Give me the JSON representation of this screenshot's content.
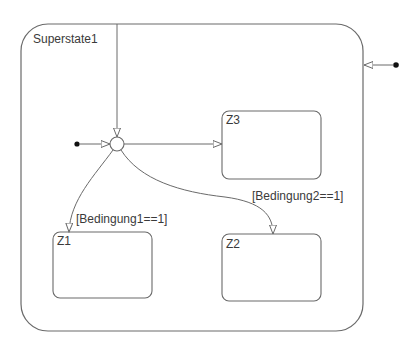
{
  "diagram": {
    "type": "statechart",
    "colors": {
      "line": "#6a6a6a",
      "text": "#3a3a3a",
      "background": "#ffffff",
      "dot": "#111111"
    },
    "superstate": {
      "name": "Superstate1"
    },
    "states": [
      {
        "id": "z3",
        "name": "Z3"
      },
      {
        "id": "z1",
        "name": "Z1"
      },
      {
        "id": "z2",
        "name": "Z2"
      }
    ],
    "junction": {
      "type": "connective-junction"
    },
    "transitions": [
      {
        "from": "external-top",
        "to": "junction",
        "label": ""
      },
      {
        "from": "default-inner",
        "to": "junction",
        "label": ""
      },
      {
        "from": "junction",
        "to": "Z3",
        "label": ""
      },
      {
        "from": "junction",
        "to": "Z1",
        "label": "[Bedingung1==1]"
      },
      {
        "from": "junction",
        "to": "Z2",
        "label": "[Bedingung2==1]"
      },
      {
        "from": "default-outer",
        "to": "Superstate1",
        "label": ""
      }
    ],
    "guards": {
      "g1": "[Bedingung1==1]",
      "g2": "[Bedingung2==1]"
    }
  }
}
